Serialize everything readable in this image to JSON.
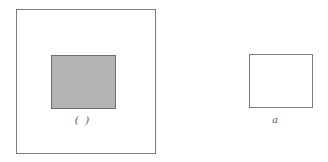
{
  "diagram": {
    "left_figure": {
      "outer_square": {
        "fill": "#ffffff",
        "stroke": "#7a7a7a"
      },
      "inner_rect": {
        "fill": "#b3b3b3",
        "stroke": "#6e6e6e"
      },
      "label": "( )"
    },
    "right_figure": {
      "rect": {
        "fill": "#ffffff",
        "stroke": "#7a7a7a"
      },
      "label": "a"
    }
  }
}
